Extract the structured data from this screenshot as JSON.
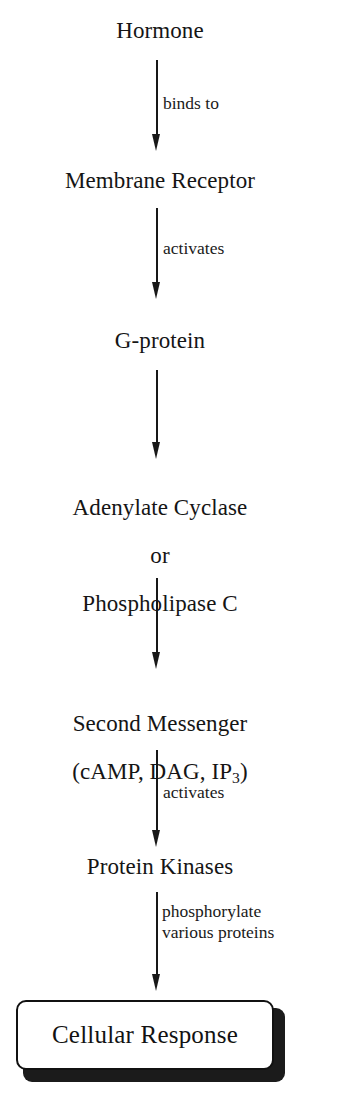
{
  "diagram": {
    "orientation": "top-to-bottom",
    "ink_color": "#151515",
    "background_color": "#ffffff",
    "nodes": [
      {
        "id": "hormone",
        "label": "Hormone",
        "shape": "text"
      },
      {
        "id": "receptor",
        "label": "Membrane Receptor",
        "shape": "text"
      },
      {
        "id": "gprotein",
        "label": "G-protein",
        "shape": "text"
      },
      {
        "id": "enzyme",
        "label": "Adenylate Cyclase\nor\nPhospholipase C",
        "shape": "text"
      },
      {
        "id": "second-messenger",
        "label": "Second Messenger\n(cAMP, DAG, IP3)",
        "shape": "text"
      },
      {
        "id": "kinases",
        "label": "Protein Kinases",
        "shape": "text"
      },
      {
        "id": "response",
        "label": "Cellular Response",
        "shape": "rounded-box-shadowed"
      }
    ],
    "node_labels": {
      "hormone": "Hormone",
      "receptor": "Membrane Receptor",
      "gprotein": "G-protein",
      "enzyme_line1": "Adenylate Cyclase",
      "enzyme_line2": "or",
      "enzyme_line3": "Phospholipase C",
      "messenger_line1": "Second Messenger",
      "messenger_line2_prefix": "(cAMP, DAG, IP",
      "messenger_line2_sub": "3",
      "messenger_line2_suffix": ")",
      "kinases": "Protein Kinases",
      "response": "Cellular Response"
    },
    "edges": [
      {
        "id": "e1",
        "from": "hormone",
        "to": "receptor",
        "label": "binds to"
      },
      {
        "id": "e2",
        "from": "receptor",
        "to": "gprotein",
        "label": "activates"
      },
      {
        "id": "e3",
        "from": "gprotein",
        "to": "enzyme",
        "label": ""
      },
      {
        "id": "e4",
        "from": "enzyme",
        "to": "second-messenger",
        "label": ""
      },
      {
        "id": "e5",
        "from": "second-messenger",
        "to": "kinases",
        "label": "activates"
      },
      {
        "id": "e6",
        "from": "kinases",
        "to": "response",
        "label": "phosphorylate\nvarious proteins"
      }
    ],
    "edge_labels": {
      "binds_to": "binds to",
      "activates_1": "activates",
      "activates_2": "activates",
      "phosphorylate": "phosphorylate\nvarious proteins"
    }
  }
}
